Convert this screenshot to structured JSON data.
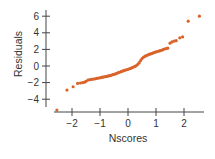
{
  "chart_data": {
    "type": "scatter",
    "title": "",
    "xlabel": "Nscores",
    "ylabel": "Residuals",
    "xlim": [
      -2.65,
      2.7
    ],
    "ylim": [
      -5.7,
      6.6
    ],
    "xticks": [
      -2,
      -1,
      0,
      1,
      2
    ],
    "yticks": [
      -4,
      -2,
      0,
      2,
      4,
      6
    ],
    "xtick_labels": [
      "−2",
      "−1",
      "0",
      "1",
      "2"
    ],
    "ytick_labels": [
      "−4",
      "−2",
      "0",
      "2",
      "4",
      "6"
    ],
    "grid": false,
    "legend": null,
    "marker_color": "#d9642a",
    "axis_color": "#444444",
    "points": [
      [
        -2.54,
        -5.3
      ],
      [
        -2.18,
        -2.9
      ],
      [
        -1.96,
        -2.5
      ],
      [
        -1.8,
        -2.1
      ],
      [
        -1.7,
        -2.05
      ],
      [
        -1.62,
        -2.0
      ],
      [
        -1.55,
        -1.95
      ],
      [
        -1.5,
        -1.85
      ],
      [
        -1.43,
        -1.7
      ],
      [
        -1.36,
        -1.65
      ],
      [
        -1.3,
        -1.6
      ],
      [
        -1.24,
        -1.58
      ],
      [
        -1.18,
        -1.55
      ],
      [
        -1.12,
        -1.5
      ],
      [
        -1.06,
        -1.45
      ],
      [
        -1.0,
        -1.42
      ],
      [
        -0.95,
        -1.38
      ],
      [
        -0.9,
        -1.35
      ],
      [
        -0.85,
        -1.3
      ],
      [
        -0.8,
        -1.28
      ],
      [
        -0.75,
        -1.25
      ],
      [
        -0.7,
        -1.2
      ],
      [
        -0.65,
        -1.17
      ],
      [
        -0.6,
        -1.12
      ],
      [
        -0.55,
        -1.05
      ],
      [
        -0.5,
        -1.0
      ],
      [
        -0.45,
        -0.95
      ],
      [
        -0.4,
        -0.88
      ],
      [
        -0.35,
        -0.8
      ],
      [
        -0.3,
        -0.75
      ],
      [
        -0.25,
        -0.68
      ],
      [
        -0.2,
        -0.62
      ],
      [
        -0.15,
        -0.55
      ],
      [
        -0.1,
        -0.5
      ],
      [
        -0.05,
        -0.45
      ],
      [
        0.0,
        -0.4
      ],
      [
        0.05,
        -0.33
      ],
      [
        0.1,
        -0.28
      ],
      [
        0.15,
        -0.2
      ],
      [
        0.2,
        -0.12
      ],
      [
        0.25,
        -0.05
      ],
      [
        0.3,
        0.05
      ],
      [
        0.35,
        0.2
      ],
      [
        0.4,
        0.4
      ],
      [
        0.45,
        0.65
      ],
      [
        0.5,
        0.9
      ],
      [
        0.55,
        1.05
      ],
      [
        0.6,
        1.15
      ],
      [
        0.65,
        1.25
      ],
      [
        0.7,
        1.32
      ],
      [
        0.75,
        1.4
      ],
      [
        0.8,
        1.45
      ],
      [
        0.85,
        1.5
      ],
      [
        0.9,
        1.58
      ],
      [
        0.95,
        1.65
      ],
      [
        1.0,
        1.7
      ],
      [
        1.05,
        1.75
      ],
      [
        1.1,
        1.8
      ],
      [
        1.15,
        1.85
      ],
      [
        1.2,
        1.9
      ],
      [
        1.25,
        1.97
      ],
      [
        1.3,
        2.05
      ],
      [
        1.36,
        2.1
      ],
      [
        1.42,
        2.15
      ],
      [
        1.5,
        2.75
      ],
      [
        1.57,
        2.9
      ],
      [
        1.65,
        3.0
      ],
      [
        1.72,
        3.05
      ],
      [
        1.85,
        3.4
      ],
      [
        1.95,
        3.5
      ],
      [
        2.15,
        5.4
      ],
      [
        2.55,
        6.0
      ]
    ]
  }
}
